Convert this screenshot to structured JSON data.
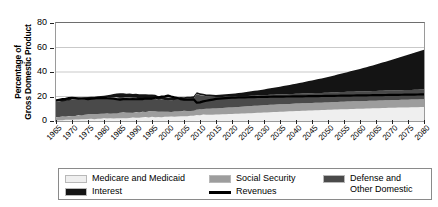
{
  "axes": {
    "ytitle_line1": "Percentage of",
    "ytitle_line2": "Gross Domestic Product",
    "yticks": [
      "0",
      "20",
      "40",
      "60",
      "80"
    ],
    "xticks": [
      "1965",
      "1970",
      "1975",
      "1980",
      "1985",
      "1990",
      "1995",
      "2000",
      "2005",
      "2010",
      "2015",
      "2020",
      "2025",
      "2030",
      "2035",
      "2040",
      "2045",
      "2050",
      "2055",
      "2060",
      "2065",
      "2070",
      "2075",
      "2080"
    ]
  },
  "legend": {
    "items": [
      {
        "label": "Medicare and Medicaid",
        "color": "#efefef",
        "kind": "area"
      },
      {
        "label": "Social Security",
        "color": "#9d9d9d",
        "kind": "area"
      },
      {
        "label": "Defense and\nOther Domestic",
        "color": "#4a4a4a",
        "kind": "area"
      },
      {
        "label": "Interest",
        "color": "#141414",
        "kind": "area"
      },
      {
        "label": "Revenues",
        "color": "#000000",
        "kind": "line"
      }
    ]
  },
  "chart_data": {
    "type": "area",
    "title": "",
    "xlabel": "",
    "ylabel": "Percentage of Gross Domestic Product",
    "xlim": [
      1965,
      2080
    ],
    "ylim": [
      0,
      80
    ],
    "grid": true,
    "stacked": true,
    "legend_position": "bottom",
    "x": [
      1965,
      1970,
      1975,
      1980,
      1985,
      1990,
      1995,
      2000,
      2005,
      2008,
      2009,
      2010,
      2012,
      2015,
      2020,
      2025,
      2030,
      2035,
      2040,
      2045,
      2050,
      2055,
      2060,
      2065,
      2070,
      2075,
      2080
    ],
    "series": [
      {
        "name": "Medicare and Medicaid",
        "color": "#efefef",
        "values": [
          0.6,
          1.0,
          1.5,
          1.9,
          2.3,
          2.7,
          3.3,
          3.3,
          4.0,
          4.3,
          4.7,
          4.9,
          5.0,
          5.3,
          5.8,
          6.3,
          6.9,
          7.5,
          8.1,
          8.6,
          9.1,
          9.6,
          10.0,
          10.4,
          10.8,
          11.1,
          11.4
        ]
      },
      {
        "name": "Social Security",
        "color": "#9d9d9d",
        "values": [
          2.5,
          3.0,
          4.1,
          4.3,
          4.4,
          4.3,
          4.5,
          4.1,
          4.2,
          4.3,
          4.8,
          4.9,
          5.0,
          5.0,
          5.3,
          5.7,
          6.0,
          6.1,
          6.1,
          6.1,
          6.1,
          6.2,
          6.2,
          6.2,
          6.3,
          6.3,
          6.4
        ]
      },
      {
        "name": "Defense and Other Domestic",
        "color": "#4a4a4a",
        "values": [
          12.5,
          13.2,
          12.4,
          12.6,
          12.8,
          11.8,
          10.6,
          9.3,
          9.7,
          10.0,
          12.5,
          11.3,
          10.3,
          9.3,
          8.7,
          8.4,
          8.2,
          8.1,
          8.0,
          8.0,
          7.9,
          7.9,
          7.9,
          7.9,
          7.9,
          7.9,
          7.9
        ]
      },
      {
        "name": "Interest",
        "color": "#141414",
        "values": [
          1.2,
          1.4,
          1.5,
          1.9,
          3.1,
          3.2,
          3.2,
          2.3,
          1.5,
          1.7,
          1.3,
          1.4,
          1.4,
          1.6,
          2.4,
          3.4,
          4.7,
          6.3,
          8.2,
          10.4,
          12.8,
          15.5,
          18.4,
          21.6,
          25.0,
          28.7,
          32.5
        ]
      }
    ],
    "lines": [
      {
        "name": "Revenues",
        "color": "#000000",
        "values": [
          17.0,
          19.0,
          17.9,
          19.0,
          17.7,
          17.8,
          18.4,
          20.6,
          17.3,
          17.5,
          14.8,
          15.1,
          16.5,
          18.0,
          19.1,
          19.4,
          19.7,
          19.9,
          20.1,
          20.3,
          20.5,
          20.7,
          20.9,
          21.1,
          21.3,
          21.5,
          21.7
        ]
      }
    ]
  }
}
